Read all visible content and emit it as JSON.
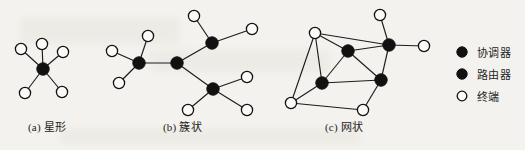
{
  "figure": {
    "background_color": "#f4f2ee",
    "ink_color": "#111111",
    "node_fill_light": "#fbfaf8"
  },
  "panels": [
    {
      "id": "star",
      "caption": "(a) 星形",
      "caption_x": 28,
      "caption_y": 118,
      "nodes": [
        {
          "name": "coordinator",
          "type": "dark",
          "cx": 43,
          "cy": 69,
          "r": 6.2
        },
        {
          "name": "end-device-top",
          "type": "light",
          "cx": 42,
          "cy": 44,
          "r": 5.6
        },
        {
          "name": "end-device-upper-left",
          "type": "light",
          "cx": 21,
          "cy": 49,
          "r": 5.6
        },
        {
          "name": "end-device-upper-right",
          "type": "light",
          "cx": 63,
          "cy": 52,
          "r": 5.6
        },
        {
          "name": "end-device-lower-left",
          "type": "light",
          "cx": 25,
          "cy": 93,
          "r": 5.6
        },
        {
          "name": "end-device-lower-right",
          "type": "light",
          "cx": 62,
          "cy": 92,
          "r": 5.6
        }
      ],
      "edges": [
        [
          0,
          1
        ],
        [
          0,
          2
        ],
        [
          0,
          3
        ],
        [
          0,
          4
        ],
        [
          0,
          5
        ]
      ]
    },
    {
      "id": "cluster-tree",
      "caption": "(b) 簇状",
      "caption_x": 163,
      "caption_y": 118,
      "nodes": [
        {
          "name": "router-left",
          "type": "dark",
          "cx": 139,
          "cy": 63,
          "r": 6.2
        },
        {
          "name": "coordinator-center",
          "type": "dark",
          "cx": 177,
          "cy": 63,
          "r": 6.2
        },
        {
          "name": "router-upper-right",
          "type": "dark",
          "cx": 212,
          "cy": 43,
          "r": 6.2
        },
        {
          "name": "router-lower-right",
          "type": "dark",
          "cx": 213,
          "cy": 89,
          "r": 6.2
        },
        {
          "name": "end-device-left-top",
          "type": "light",
          "cx": 148,
          "cy": 36,
          "r": 5.6
        },
        {
          "name": "end-device-left-side",
          "type": "light",
          "cx": 112,
          "cy": 51,
          "r": 5.6
        },
        {
          "name": "end-device-left-bottom",
          "type": "light",
          "cx": 119,
          "cy": 83,
          "r": 5.6
        },
        {
          "name": "end-device-top-right",
          "type": "light",
          "cx": 194,
          "cy": 16,
          "r": 5.6
        },
        {
          "name": "end-device-right-upper",
          "type": "light",
          "cx": 252,
          "cy": 29,
          "r": 5.6
        },
        {
          "name": "end-device-right-mid",
          "type": "light",
          "cx": 247,
          "cy": 77,
          "r": 5.6
        },
        {
          "name": "end-device-bottom-left",
          "type": "light",
          "cx": 188,
          "cy": 110,
          "r": 5.6
        },
        {
          "name": "end-device-bottom-right",
          "type": "light",
          "cx": 247,
          "cy": 110,
          "r": 5.6
        }
      ],
      "edges": [
        [
          0,
          1
        ],
        [
          1,
          2
        ],
        [
          1,
          3
        ],
        [
          0,
          4
        ],
        [
          0,
          5
        ],
        [
          0,
          6
        ],
        [
          2,
          7
        ],
        [
          2,
          8
        ],
        [
          3,
          9
        ],
        [
          3,
          10
        ],
        [
          3,
          11
        ]
      ]
    },
    {
      "id": "mesh",
      "caption": "(c) 网状",
      "caption_x": 325,
      "caption_y": 118,
      "nodes": [
        {
          "name": "end-device-top-left",
          "type": "light",
          "cx": 315,
          "cy": 33,
          "r": 5.6
        },
        {
          "name": "coordinator-right",
          "type": "dark",
          "cx": 389,
          "cy": 45,
          "r": 6.2
        },
        {
          "name": "router-center",
          "type": "dark",
          "cx": 348,
          "cy": 51,
          "r": 6.2
        },
        {
          "name": "router-left",
          "type": "dark",
          "cx": 322,
          "cy": 83,
          "r": 6.2
        },
        {
          "name": "router-right",
          "type": "dark",
          "cx": 381,
          "cy": 80,
          "r": 6.2
        },
        {
          "name": "end-device-top-right",
          "type": "light",
          "cx": 380,
          "cy": 15,
          "r": 5.6
        },
        {
          "name": "end-device-far-right",
          "type": "light",
          "cx": 424,
          "cy": 46,
          "r": 5.6
        },
        {
          "name": "end-device-bottom-left",
          "type": "light",
          "cx": 291,
          "cy": 103,
          "r": 5.6
        },
        {
          "name": "end-device-bottom-mid",
          "type": "light",
          "cx": 363,
          "cy": 110,
          "r": 5.6
        }
      ],
      "edges": [
        [
          0,
          1
        ],
        [
          0,
          2
        ],
        [
          0,
          3
        ],
        [
          0,
          7
        ],
        [
          2,
          1
        ],
        [
          2,
          3
        ],
        [
          2,
          4
        ],
        [
          1,
          4
        ],
        [
          1,
          5
        ],
        [
          1,
          6
        ],
        [
          3,
          4
        ],
        [
          3,
          7
        ],
        [
          4,
          8
        ],
        [
          7,
          8
        ]
      ]
    }
  ],
  "legend": {
    "items": [
      {
        "icon": "filled-circle-icon",
        "type": "dark",
        "label": "协调器"
      },
      {
        "icon": "filled-circle-icon",
        "type": "dark",
        "label": "路由器"
      },
      {
        "icon": "hollow-circle-icon",
        "type": "light",
        "label": "终端"
      }
    ]
  }
}
